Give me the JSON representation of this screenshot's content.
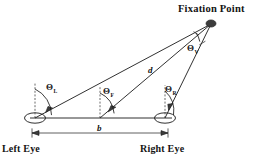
{
  "diagram": {
    "fixation_point": {
      "label": "Fixation Point",
      "marker": "filled-dot"
    },
    "eyes": {
      "left": {
        "label": "Left Eye",
        "marker": "eye-ellipse"
      },
      "right": {
        "label": "Right Eye",
        "marker": "eye-ellipse"
      }
    },
    "angles": [
      {
        "name": "left-eye-angle",
        "symbol": "Θ",
        "subscript": "L",
        "vertex": "left-eye"
      },
      {
        "name": "fixation-angle",
        "symbol": "Θ",
        "subscript": "F",
        "vertex": "baseline-midpoint"
      },
      {
        "name": "right-eye-angle",
        "symbol": "Θ",
        "subscript": "R",
        "vertex": "right-eye"
      },
      {
        "name": "vergence-angle",
        "symbol": "Θ",
        "subscript": "V",
        "vertex": "fixation-point"
      }
    ],
    "dimensions": [
      {
        "name": "distance",
        "label": "d",
        "from": "baseline-midpoint",
        "to": "fixation-point"
      },
      {
        "name": "baseline",
        "label": "b",
        "from": "left-eye",
        "to": "right-eye"
      }
    ],
    "colors": {
      "ink": "#1a1a1a",
      "dash": "#3a3a3a",
      "dot": "#3c3c3c",
      "background": "#ffffff"
    }
  }
}
